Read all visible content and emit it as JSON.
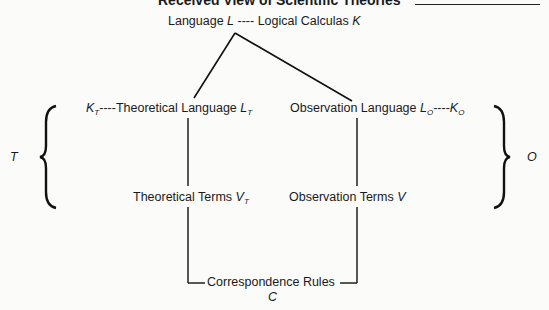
{
  "title": "Received View of Scientific Theories",
  "nodes": {
    "language": {
      "text": "Language ",
      "symbol": "L",
      "sep": " ---- ",
      "calc_text": "Logical Calculas ",
      "calc_symbol": "K"
    },
    "theoretical_language": {
      "pre_symbol": "K",
      "pre_sub": "T",
      "sep": "----",
      "text": "Theoretical Language ",
      "symbol": "L",
      "sub": "T"
    },
    "observation_language": {
      "text": "Observation Language ",
      "symbol": "L",
      "sub": "O",
      "sep": "----",
      "post_symbol": "K",
      "post_sub": "O"
    },
    "theoretical_terms": {
      "text": "Theoretical Terms ",
      "symbol": "V",
      "sub": "T"
    },
    "observation_terms": {
      "text": "Observation Terms ",
      "symbol": "V"
    },
    "correspondence_rules": {
      "text": "Correspondence Rules",
      "symbol": "C"
    }
  },
  "brace_labels": {
    "left": "T",
    "right": "O"
  }
}
